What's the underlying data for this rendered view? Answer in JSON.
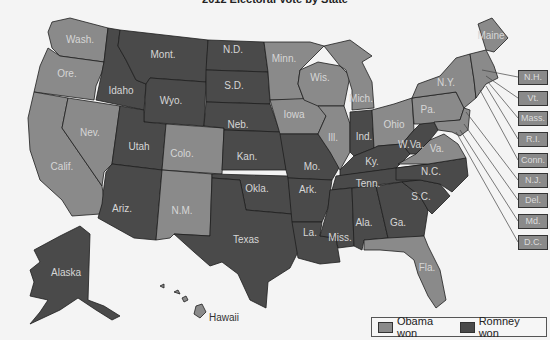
{
  "title": "2012 Electoral Vote by State",
  "colors": {
    "obama": "#8a8a8a",
    "romney": "#4a4a4a",
    "background": "#f4f4f4"
  },
  "legend": {
    "items": [
      {
        "label": "Obama won",
        "color": "#8a8a8a"
      },
      {
        "label": "Romney won",
        "color": "#4a4a4a"
      }
    ]
  },
  "states": {
    "wash": {
      "label": "Wash.",
      "winner": "Obama"
    },
    "ore": {
      "label": "Ore.",
      "winner": "Obama"
    },
    "calif": {
      "label": "Calif.",
      "winner": "Obama"
    },
    "nev": {
      "label": "Nev.",
      "winner": "Obama"
    },
    "idaho": {
      "label": "Idaho",
      "winner": "Romney"
    },
    "mont": {
      "label": "Mont.",
      "winner": "Romney"
    },
    "wyo": {
      "label": "Wyo.",
      "winner": "Romney"
    },
    "utah": {
      "label": "Utah",
      "winner": "Romney"
    },
    "colo": {
      "label": "Colo.",
      "winner": "Obama"
    },
    "ariz": {
      "label": "Ariz.",
      "winner": "Romney"
    },
    "nm": {
      "label": "N.M.",
      "winner": "Obama"
    },
    "nd": {
      "label": "N.D.",
      "winner": "Romney"
    },
    "sd": {
      "label": "S.D.",
      "winner": "Romney"
    },
    "neb": {
      "label": "Neb.",
      "winner": "Romney"
    },
    "kan": {
      "label": "Kan.",
      "winner": "Romney"
    },
    "okla": {
      "label": "Okla.",
      "winner": "Romney"
    },
    "texas": {
      "label": "Texas",
      "winner": "Romney"
    },
    "minn": {
      "label": "Minn.",
      "winner": "Obama"
    },
    "iowa": {
      "label": "Iowa",
      "winner": "Obama"
    },
    "mo": {
      "label": "Mo.",
      "winner": "Romney"
    },
    "ark": {
      "label": "Ark.",
      "winner": "Romney"
    },
    "la": {
      "label": "La.",
      "winner": "Romney"
    },
    "wis": {
      "label": "Wis.",
      "winner": "Obama"
    },
    "ill": {
      "label": "Ill.",
      "winner": "Obama"
    },
    "mich": {
      "label": "Mich.",
      "winner": "Obama"
    },
    "ind": {
      "label": "Ind.",
      "winner": "Romney"
    },
    "ohio": {
      "label": "Ohio",
      "winner": "Obama"
    },
    "ky": {
      "label": "Ky.",
      "winner": "Romney"
    },
    "tenn": {
      "label": "Tenn.",
      "winner": "Romney"
    },
    "miss": {
      "label": "Miss.",
      "winner": "Romney"
    },
    "ala": {
      "label": "Ala.",
      "winner": "Romney"
    },
    "ga": {
      "label": "Ga.",
      "winner": "Romney"
    },
    "fla": {
      "label": "Fla.",
      "winner": "Obama"
    },
    "sc": {
      "label": "S.C.",
      "winner": "Romney"
    },
    "nc": {
      "label": "N.C.",
      "winner": "Romney"
    },
    "va": {
      "label": "Va.",
      "winner": "Obama"
    },
    "wva": {
      "label": "W.Va.",
      "winner": "Romney"
    },
    "pa": {
      "label": "Pa.",
      "winner": "Obama"
    },
    "ny": {
      "label": "N.Y.",
      "winner": "Obama"
    },
    "maine": {
      "label": "Maine",
      "winner": "Obama"
    },
    "alaska": {
      "label": "Alaska",
      "winner": "Romney"
    },
    "hawaii": {
      "label": "Hawaii",
      "winner": "Obama"
    }
  },
  "callouts": [
    {
      "label": "N.H.",
      "winner": "Obama"
    },
    {
      "label": "Vt.",
      "winner": "Obama"
    },
    {
      "label": "Mass.",
      "winner": "Obama"
    },
    {
      "label": "R.I.",
      "winner": "Obama"
    },
    {
      "label": "Conn.",
      "winner": "Obama"
    },
    {
      "label": "N.J.",
      "winner": "Obama"
    },
    {
      "label": "Del.",
      "winner": "Obama"
    },
    {
      "label": "Md.",
      "winner": "Obama"
    },
    {
      "label": "D.C.",
      "winner": "Obama"
    }
  ]
}
